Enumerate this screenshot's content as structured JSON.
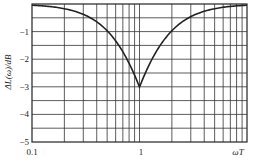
{
  "chart_data": {
    "type": "line",
    "title": "",
    "xlabel": "ωT",
    "ylabel": "ΔL(ω)/dB",
    "xscale": "log",
    "xlim": [
      0.1,
      10
    ],
    "ylim": [
      -5,
      0
    ],
    "x_tick_labels": [
      "0.1",
      "1",
      "ωT"
    ],
    "y_tick_labels": [
      "-1",
      "-2",
      "-3",
      "-4",
      "-5"
    ],
    "y_ticks": [
      -1,
      -2,
      -3,
      -4,
      -5
    ],
    "grid": true,
    "legend": null,
    "series": [
      {
        "name": "ΔL(ω)",
        "x": [
          0.1,
          0.15,
          0.2,
          0.3,
          0.4,
          0.5,
          0.6,
          0.7,
          0.8,
          0.9,
          1.0,
          1.11,
          1.25,
          1.43,
          1.67,
          2.0,
          2.5,
          3.33,
          5.0,
          6.67,
          10
        ],
        "values": [
          -0.04,
          -0.1,
          -0.17,
          -0.37,
          -0.64,
          -0.97,
          -1.34,
          -1.74,
          -2.15,
          -2.58,
          -3.01,
          -2.58,
          -2.15,
          -1.74,
          -1.34,
          -0.97,
          -0.64,
          -0.37,
          -0.17,
          -0.1,
          -0.04
        ]
      }
    ]
  }
}
